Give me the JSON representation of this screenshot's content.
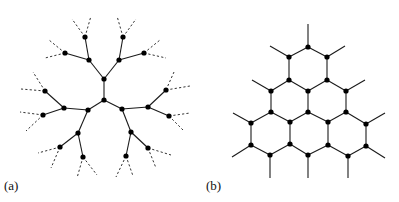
{
  "panels": [
    {
      "id": "a",
      "label": "(a)",
      "description": "Bethe lattice / Cayley tree with coordination number 3; outer branches dashed",
      "nodes": [
        [
          104,
          79
        ],
        [
          104,
          100
        ],
        [
          89,
          60
        ],
        [
          119,
          60
        ],
        [
          85,
          37
        ],
        [
          65,
          53
        ],
        [
          123,
          37
        ],
        [
          144,
          53
        ],
        [
          88,
          110
        ],
        [
          122,
          109
        ],
        [
          64,
          108
        ],
        [
          148,
          107
        ],
        [
          45,
          91
        ],
        [
          43,
          115
        ],
        [
          166,
          90
        ],
        [
          169,
          116
        ],
        [
          78,
          133
        ],
        [
          131,
          132
        ],
        [
          60,
          147
        ],
        [
          83,
          157
        ],
        [
          148,
          148
        ],
        [
          126,
          156
        ]
      ],
      "edges": [
        [
          0,
          1
        ],
        [
          0,
          2
        ],
        [
          0,
          3
        ],
        [
          2,
          4
        ],
        [
          2,
          5
        ],
        [
          3,
          6
        ],
        [
          3,
          7
        ],
        [
          1,
          8
        ],
        [
          1,
          9
        ],
        [
          8,
          10
        ],
        [
          8,
          16
        ],
        [
          9,
          11
        ],
        [
          9,
          17
        ],
        [
          10,
          12
        ],
        [
          10,
          13
        ],
        [
          11,
          14
        ],
        [
          11,
          15
        ],
        [
          16,
          18
        ],
        [
          16,
          19
        ],
        [
          17,
          20
        ],
        [
          17,
          21
        ]
      ],
      "dashed_edges": [
        [
          [
            85,
            37
          ],
          [
            72,
            19
          ]
        ],
        [
          [
            85,
            37
          ],
          [
            91,
            16
          ]
        ],
        [
          [
            65,
            53
          ],
          [
            49,
            40
          ]
        ],
        [
          [
            65,
            53
          ],
          [
            45,
            58
          ]
        ],
        [
          [
            123,
            37
          ],
          [
            117,
            16
          ]
        ],
        [
          [
            123,
            37
          ],
          [
            136,
            19
          ]
        ],
        [
          [
            144,
            53
          ],
          [
            160,
            40
          ]
        ],
        [
          [
            144,
            53
          ],
          [
            166,
            58
          ]
        ],
        [
          [
            45,
            91
          ],
          [
            33,
            72
          ]
        ],
        [
          [
            45,
            91
          ],
          [
            21,
            89
          ]
        ],
        [
          [
            43,
            115
          ],
          [
            20,
            112
          ]
        ],
        [
          [
            43,
            115
          ],
          [
            26,
            131
          ]
        ],
        [
          [
            166,
            90
          ],
          [
            174,
            72
          ]
        ],
        [
          [
            166,
            90
          ],
          [
            190,
            86
          ]
        ],
        [
          [
            169,
            116
          ],
          [
            190,
            113
          ]
        ],
        [
          [
            169,
            116
          ],
          [
            184,
            131
          ]
        ],
        [
          [
            60,
            147
          ],
          [
            38,
            153
          ]
        ],
        [
          [
            60,
            147
          ],
          [
            51,
            168
          ]
        ],
        [
          [
            83,
            157
          ],
          [
            77,
            178
          ]
        ],
        [
          [
            83,
            157
          ],
          [
            97,
            175
          ]
        ],
        [
          [
            148,
            148
          ],
          [
            171,
            155
          ]
        ],
        [
          [
            148,
            148
          ],
          [
            156,
            168
          ]
        ],
        [
          [
            126,
            156
          ],
          [
            116,
            177
          ]
        ],
        [
          [
            126,
            156
          ],
          [
            133,
            176
          ]
        ]
      ]
    },
    {
      "id": "b",
      "label": "(b)",
      "description": "Triangular patch of honeycomb lattice (6 hexagons) with dangling bonds",
      "nodes": [
        [
          308,
          47
        ],
        [
          289,
          57
        ],
        [
          327,
          57
        ],
        [
          289,
          80
        ],
        [
          327,
          80
        ],
        [
          271,
          91
        ],
        [
          308,
          91
        ],
        [
          346,
          91
        ],
        [
          271,
          112
        ],
        [
          308,
          112
        ],
        [
          346,
          112
        ],
        [
          251,
          123
        ],
        [
          290,
          122
        ],
        [
          328,
          122
        ],
        [
          366,
          124
        ],
        [
          251,
          145
        ],
        [
          290,
          144
        ],
        [
          328,
          145
        ],
        [
          366,
          146
        ],
        [
          270,
          155
        ],
        [
          308,
          155
        ],
        [
          348,
          156
        ]
      ],
      "edges": [
        [
          0,
          1
        ],
        [
          0,
          2
        ],
        [
          1,
          3
        ],
        [
          2,
          4
        ],
        [
          3,
          5
        ],
        [
          3,
          6
        ],
        [
          4,
          6
        ],
        [
          4,
          7
        ],
        [
          5,
          8
        ],
        [
          6,
          9
        ],
        [
          7,
          10
        ],
        [
          8,
          11
        ],
        [
          8,
          12
        ],
        [
          9,
          12
        ],
        [
          9,
          13
        ],
        [
          10,
          13
        ],
        [
          10,
          14
        ],
        [
          11,
          15
        ],
        [
          12,
          16
        ],
        [
          13,
          17
        ],
        [
          14,
          18
        ],
        [
          15,
          19
        ],
        [
          16,
          19
        ],
        [
          16,
          20
        ],
        [
          17,
          20
        ],
        [
          17,
          21
        ],
        [
          18,
          21
        ]
      ],
      "stubs": [
        [
          [
            308,
            47
          ],
          [
            308,
            24
          ]
        ],
        [
          [
            289,
            57
          ],
          [
            270,
            46
          ]
        ],
        [
          [
            327,
            57
          ],
          [
            345,
            46
          ]
        ],
        [
          [
            271,
            91
          ],
          [
            252,
            80
          ]
        ],
        [
          [
            346,
            91
          ],
          [
            365,
            80
          ]
        ],
        [
          [
            251,
            123
          ],
          [
            233,
            113
          ]
        ],
        [
          [
            366,
            124
          ],
          [
            385,
            113
          ]
        ],
        [
          [
            251,
            145
          ],
          [
            232,
            157
          ]
        ],
        [
          [
            366,
            146
          ],
          [
            385,
            158
          ]
        ],
        [
          [
            270,
            155
          ],
          [
            270,
            178
          ]
        ],
        [
          [
            308,
            155
          ],
          [
            308,
            178
          ]
        ],
        [
          [
            348,
            156
          ],
          [
            348,
            178
          ]
        ]
      ]
    }
  ]
}
